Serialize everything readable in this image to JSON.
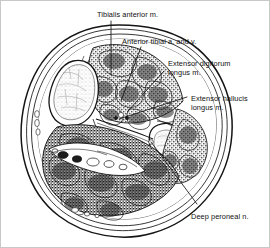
{
  "figure": {
    "kind": "anatomical-cross-section",
    "region": "right leg, transverse section through proximal third",
    "style": "black-and-white line drawing with stippled muscle shading",
    "background_color": "#ffffff",
    "ink_color": "#1a1a1a",
    "border_color": "#c8c8c8"
  },
  "labels": [
    {
      "id": "tibialis-anterior",
      "line1": "Tibialis anterior m.",
      "line2": "",
      "x": 96,
      "y": 9,
      "align": "left"
    },
    {
      "id": "anterior-tibial-vessels",
      "line1": "Anterior tibial a. and v.",
      "line2": "",
      "x": 121,
      "y": 36,
      "align": "left"
    },
    {
      "id": "extensor-digitorum-longus",
      "line1": "Extensor digitorum",
      "line2": "longus m.",
      "x": 167,
      "y": 58,
      "align": "left"
    },
    {
      "id": "extensor-hallucis-longus",
      "line1": "Extensor hallucis",
      "line2": "longus m.",
      "x": 190,
      "y": 93,
      "align": "left"
    },
    {
      "id": "deep-peroneal-nerve",
      "line1": "Deep peroneal n.",
      "line2": "",
      "x": 190,
      "y": 211,
      "align": "left"
    }
  ],
  "leaders": [
    {
      "id": "leader-tibialis-anterior",
      "points": "110,20 110,74"
    },
    {
      "id": "leader-anterior-tibial-vessels",
      "points": "140,46 120,100"
    },
    {
      "id": "leader-extensor-digitorum-longus",
      "points": "163,70 127,110"
    },
    {
      "id": "leader-extensor-hallucis-longus",
      "points": "186,96 118,118"
    },
    {
      "id": "leader-deep-peroneal-nerve",
      "points": "196,203 150,141"
    }
  ],
  "structures": [
    {
      "id": "skin-outline",
      "name": "skin / subcutaneous outline"
    },
    {
      "id": "deep-fascia",
      "name": "deep fascia of leg"
    },
    {
      "id": "tibia",
      "name": "tibia (cortical and cancellous bone)"
    },
    {
      "id": "fibula",
      "name": "fibula"
    },
    {
      "id": "interosseous-membrane",
      "name": "interosseous membrane"
    },
    {
      "id": "anterior-compartment",
      "name": "anterior compartment muscles"
    },
    {
      "id": "lateral-compartment",
      "name": "lateral compartment muscles"
    },
    {
      "id": "posterior-compartment",
      "name": "posterior compartment muscles"
    },
    {
      "id": "neurovascular-bundle",
      "name": "posterior tibial neurovascular bundle"
    }
  ]
}
